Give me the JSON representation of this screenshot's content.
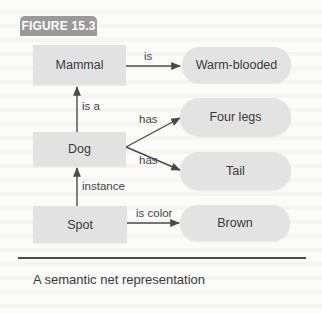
{
  "figure": {
    "label": "FIGURE 15.3",
    "caption": "A semantic net representation"
  },
  "nodes": {
    "mammal": "Mammal",
    "dog": "Dog",
    "spot": "Spot",
    "warm_blooded": "Warm-blooded",
    "four_legs": "Four legs",
    "tail": "Tail",
    "brown": "Brown"
  },
  "edges": {
    "mammal_warm": "is",
    "dog_mammal": "is a",
    "dog_four_legs": "has",
    "dog_tail": "has",
    "spot_dog": "instance",
    "spot_brown": "is color"
  },
  "colors": {
    "label_bg": "#9a9a9a",
    "node_fill": "#e2e2e2",
    "edge": "#4a4a4a",
    "background": "#fbfbfa"
  }
}
